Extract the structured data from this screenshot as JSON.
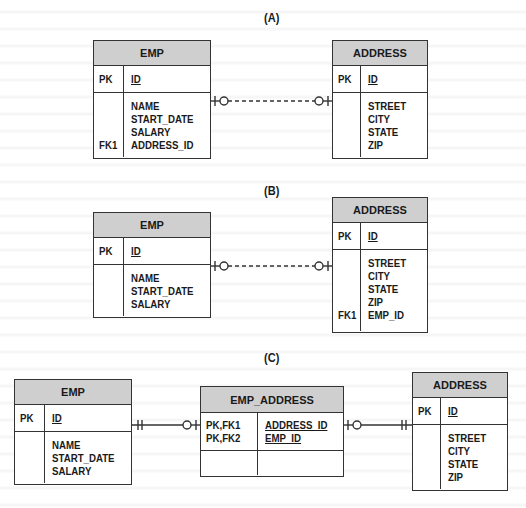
{
  "diagram": {
    "sections": [
      {
        "label": "(A)",
        "entities": [
          {
            "name": "EMP",
            "pk_keys": [
              "PK"
            ],
            "pk_attrs": [
              "ID"
            ],
            "body_keys": [
              "",
              "",
              "",
              "FK1"
            ],
            "body_attrs": [
              "NAME",
              "START_DATE",
              "SALARY",
              "ADDRESS_ID"
            ]
          },
          {
            "name": "ADDRESS",
            "pk_keys": [
              "PK"
            ],
            "pk_attrs": [
              "ID"
            ],
            "body_keys": [
              "",
              "",
              "",
              ""
            ],
            "body_attrs": [
              "STREET",
              "CITY",
              "STATE",
              "ZIP"
            ]
          }
        ],
        "relationship": {
          "from": "EMP",
          "to": "ADDRESS",
          "style": "dashed",
          "from_end": "zero-or-one",
          "to_end": "zero-or-one"
        }
      },
      {
        "label": "(B)",
        "entities": [
          {
            "name": "EMP",
            "pk_keys": [
              "PK"
            ],
            "pk_attrs": [
              "ID"
            ],
            "body_keys": [
              "",
              "",
              ""
            ],
            "body_attrs": [
              "NAME",
              "START_DATE",
              "SALARY"
            ]
          },
          {
            "name": "ADDRESS",
            "pk_keys": [
              "PK"
            ],
            "pk_attrs": [
              "ID"
            ],
            "body_keys": [
              "",
              "",
              "",
              "",
              "FK1"
            ],
            "body_attrs": [
              "STREET",
              "CITY",
              "STATE",
              "ZIP",
              "EMP_ID"
            ]
          }
        ],
        "relationship": {
          "from": "EMP",
          "to": "ADDRESS",
          "style": "dashed",
          "from_end": "zero-or-one",
          "to_end": "zero-or-one"
        }
      },
      {
        "label": "(C)",
        "entities": [
          {
            "name": "EMP",
            "pk_keys": [
              "PK"
            ],
            "pk_attrs": [
              "ID"
            ],
            "body_keys": [
              "",
              "",
              ""
            ],
            "body_attrs": [
              "NAME",
              "START_DATE",
              "SALARY"
            ]
          },
          {
            "name": "EMP_ADDRESS",
            "pk_keys": [
              "PK,FK1",
              "PK,FK2"
            ],
            "pk_attrs": [
              "ADDRESS_ID",
              "EMP_ID"
            ],
            "body_keys": [],
            "body_attrs": []
          },
          {
            "name": "ADDRESS",
            "pk_keys": [
              "PK"
            ],
            "pk_attrs": [
              "ID"
            ],
            "body_keys": [
              "",
              "",
              "",
              ""
            ],
            "body_attrs": [
              "STREET",
              "CITY",
              "STATE",
              "ZIP"
            ]
          }
        ],
        "relationships": [
          {
            "from": "EMP",
            "to": "EMP_ADDRESS",
            "style": "solid",
            "from_end": "exactly-one",
            "to_end": "zero-or-one"
          },
          {
            "from": "EMP_ADDRESS",
            "to": "ADDRESS",
            "style": "solid",
            "from_end": "zero-or-one",
            "to_end": "exactly-one"
          }
        ]
      }
    ]
  },
  "colors": {
    "header_fill": "#cfcfcf",
    "border": "#333333",
    "background": "#ffffff"
  }
}
